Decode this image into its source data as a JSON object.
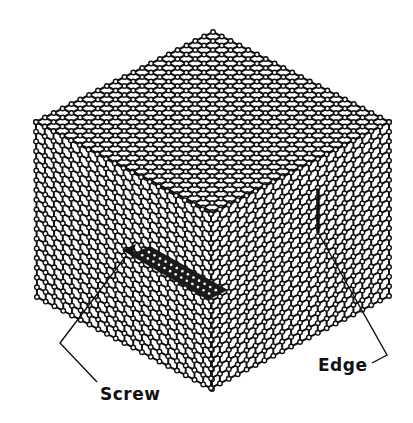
{
  "diagram": {
    "type": "crystal-lattice-dislocations",
    "labels": {
      "screw": "Screw",
      "edge": "Edge"
    },
    "colors": {
      "line": "#111111",
      "node_fill": "#ffffff",
      "background": "#ffffff"
    },
    "cube": {
      "top": [
        213,
        32
      ],
      "left": [
        36,
        122
      ],
      "right": [
        389,
        122
      ],
      "front_top": [
        211,
        214
      ],
      "left_bottom": [
        37,
        297
      ],
      "right_bottom": [
        389,
        297
      ],
      "front_bottom": [
        211,
        388
      ],
      "divisions_diag": 10,
      "divisions_vert": 9
    },
    "screw_dislocation": {
      "ribbon": [
        [
          130,
          255
        ],
        [
          150,
          246
        ],
        [
          228,
          290
        ],
        [
          208,
          300
        ]
      ],
      "arrow_tip": [
        122,
        250
      ],
      "leader": [
        [
          126,
          256
        ],
        [
          60,
          343
        ],
        [
          97,
          382
        ]
      ]
    },
    "edge_dislocation": {
      "line": [
        [
          318,
          190
        ],
        [
          318,
          232
        ]
      ],
      "leader": [
        [
          320,
          236
        ],
        [
          387,
          355
        ],
        [
          372,
          363
        ]
      ]
    }
  }
}
